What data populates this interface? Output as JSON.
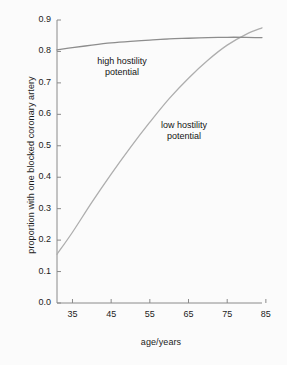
{
  "figure": {
    "background_color": "#fbfbfb",
    "frame": {
      "left": 57,
      "right": 262,
      "top": 20,
      "bottom": 303
    }
  },
  "chart_data": {
    "type": "line",
    "title": "",
    "subtitle": "",
    "xlabel": "age/years",
    "ylabel": "proportion with one blocked coronary artery",
    "xlim": [
      31,
      84
    ],
    "ylim": [
      0.0,
      0.9
    ],
    "xticks": [
      35,
      45,
      55,
      65,
      75,
      85
    ],
    "xtick_labels": [
      "35",
      "45",
      "55",
      "65",
      "75",
      "85"
    ],
    "yticks": [
      0.0,
      0.1,
      0.2,
      0.3,
      0.4,
      0.5,
      0.6,
      0.7,
      0.8,
      0.9
    ],
    "ytick_labels": [
      "0.0",
      "0.1",
      "0.2",
      "0.3",
      "0.4",
      "0.5",
      "0.6",
      "0.7",
      "0.8",
      "0.9"
    ],
    "grid": false,
    "legend": "none",
    "spines": [
      "left",
      "bottom"
    ],
    "tick_direction": "in",
    "series": [
      {
        "name": "high hostility potential",
        "color": "#8d8d8d",
        "linewidth": 1.3,
        "x": [
          31,
          35,
          40,
          45,
          50,
          55,
          60,
          65,
          70,
          75,
          80,
          84
        ],
        "values": [
          0.805,
          0.812,
          0.82,
          0.827,
          0.832,
          0.836,
          0.84,
          0.842,
          0.844,
          0.845,
          0.845,
          0.844
        ]
      },
      {
        "name": "low hostility potential",
        "color": "#aeaeae",
        "linewidth": 1.3,
        "x": [
          31,
          35,
          40,
          45,
          50,
          55,
          60,
          65,
          70,
          75,
          80,
          84
        ],
        "values": [
          0.155,
          0.225,
          0.32,
          0.41,
          0.495,
          0.575,
          0.65,
          0.715,
          0.772,
          0.82,
          0.855,
          0.875
        ]
      }
    ],
    "annotations": [
      {
        "name": "high-hostility-label",
        "text": "high hostility\npotential",
        "line1": "high hostility",
        "line2": "potential",
        "x": 42,
        "y": 0.76
      },
      {
        "name": "low-hostility-label",
        "text": "low hostility\npotential",
        "line1": "low hostility",
        "line2": "potential",
        "x": 58,
        "y": 0.57
      }
    ],
    "crossing_point": {
      "x": 78,
      "y": 0.845
    }
  }
}
